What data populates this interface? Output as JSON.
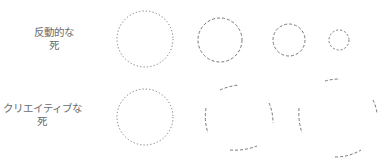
{
  "rows": [
    {
      "label_line1": "反動的な",
      "label_line2": "死"
    },
    {
      "label_line1": "クリエイティブな",
      "label_line2": "死"
    }
  ],
  "colors": {
    "stroke": "#777777",
    "text": "#6b6b6b",
    "background": "#ffffff"
  },
  "row1_circles": [
    {
      "cx": 145,
      "cy": 39,
      "r": 28,
      "dash": "1.2 2.2"
    },
    {
      "cx": 220,
      "cy": 40,
      "r": 22,
      "dash": "3 2"
    },
    {
      "cx": 289,
      "cy": 40,
      "r": 16,
      "dash": "3 2"
    },
    {
      "cx": 339,
      "cy": 40,
      "r": 10,
      "dash": "2 2"
    }
  ],
  "row2_circle": {
    "cx": 145,
    "cy": 117,
    "r": 28,
    "dash": "1.2 2.2"
  }
}
